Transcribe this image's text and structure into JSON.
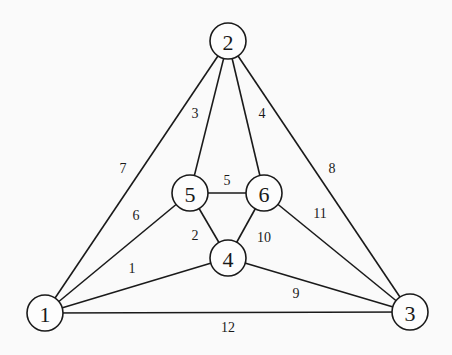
{
  "diagram": {
    "type": "graph",
    "nodes": [
      {
        "id": "1",
        "label": "1",
        "x": 45,
        "y": 313
      },
      {
        "id": "2",
        "label": "2",
        "x": 228,
        "y": 41
      },
      {
        "id": "3",
        "label": "3",
        "x": 410,
        "y": 312
      },
      {
        "id": "4",
        "label": "4",
        "x": 228,
        "y": 258
      },
      {
        "id": "5",
        "label": "5",
        "x": 190,
        "y": 193
      },
      {
        "id": "6",
        "label": "6",
        "x": 264,
        "y": 193
      }
    ],
    "edges": [
      {
        "label": "1",
        "from": "1",
        "to": "4",
        "lx": 132,
        "ly": 268
      },
      {
        "label": "2",
        "from": "5",
        "to": "4",
        "lx": 195,
        "ly": 235
      },
      {
        "label": "3",
        "from": "2",
        "to": "5",
        "lx": 195,
        "ly": 113
      },
      {
        "label": "4",
        "from": "2",
        "to": "6",
        "lx": 262,
        "ly": 113
      },
      {
        "label": "5",
        "from": "5",
        "to": "6",
        "lx": 227,
        "ly": 180
      },
      {
        "label": "6",
        "from": "1",
        "to": "5",
        "lx": 136,
        "ly": 215
      },
      {
        "label": "7",
        "from": "1",
        "to": "2",
        "lx": 123,
        "ly": 168
      },
      {
        "label": "8",
        "from": "2",
        "to": "3",
        "lx": 332,
        "ly": 168
      },
      {
        "label": "9",
        "from": "4",
        "to": "3",
        "lx": 296,
        "ly": 293
      },
      {
        "label": "10",
        "from": "6",
        "to": "4",
        "lx": 264,
        "ly": 237
      },
      {
        "label": "11",
        "from": "6",
        "to": "3",
        "lx": 320,
        "ly": 213
      },
      {
        "label": "12",
        "from": "1",
        "to": "3",
        "lx": 228,
        "ly": 327
      }
    ]
  }
}
